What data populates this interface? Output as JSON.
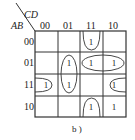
{
  "kmap": {
    "row_var": "AB",
    "col_var": "CD",
    "col_labels": [
      "00",
      "01",
      "11",
      "10"
    ],
    "row_labels": [
      "00",
      "01",
      "11",
      "10"
    ],
    "cells": [
      [
        "",
        "",
        "1",
        ""
      ],
      [
        "",
        "1",
        "1",
        "1"
      ],
      [
        "1",
        "1",
        "",
        "1"
      ],
      [
        "",
        "",
        "1",
        "1"
      ]
    ],
    "caption": "b )"
  }
}
